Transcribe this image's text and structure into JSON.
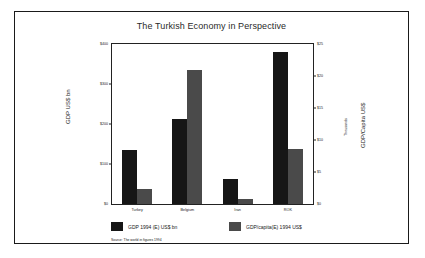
{
  "figure": {
    "source_note": "Source: The world in figures 1994"
  },
  "legend": {
    "entries": [
      {
        "label": "GDP 1994 (E) US$ bn",
        "color": "#161616"
      },
      {
        "label": "GDP/capita(E) 1994 US$",
        "color": "#4a4a4a"
      }
    ]
  },
  "chart_data": {
    "type": "bar",
    "title": "The Turkish Economy in Perspective",
    "xlabel": "",
    "ylabel": "GDP US$ bn",
    "y2label": "GDP/Capita US$",
    "y2unit": "Thousands",
    "categories": [
      "Turkey",
      "Belgium",
      "Iran",
      "ROK"
    ],
    "series": [
      {
        "name": "GDP 1994 (E) US$ bn",
        "axis": "left",
        "color": "#161616",
        "values": [
          136,
          212,
          63,
          380
        ]
      },
      {
        "name": "GDP/capita(E) 1994 US$",
        "axis": "right",
        "color": "#4a4a4a",
        "values": [
          2300,
          21000,
          800,
          8600
        ]
      }
    ],
    "ylim": [
      0,
      400
    ],
    "yticks": [
      0,
      100,
      200,
      300,
      400
    ],
    "yticklabels": [
      "$0",
      "$100",
      "$200",
      "$300",
      "$400"
    ],
    "y2lim": [
      0,
      25000
    ],
    "y2ticks": [
      0,
      5000,
      10000,
      15000,
      20000,
      25000
    ],
    "y2ticklabels": [
      "$0",
      "$5",
      "$10",
      "$15",
      "$20",
      "$25"
    ],
    "grid": false,
    "legend_position": "bottom"
  }
}
